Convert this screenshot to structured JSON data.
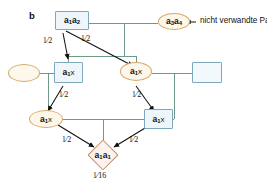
{
  "panel": {
    "label": "b"
  },
  "legend": {
    "text": "nicht verwandte Partner",
    "arrow_icon": "left-arrow-icon"
  },
  "nodes": [
    {
      "id": "founder_male",
      "shape": "square",
      "genotype_main": "a",
      "genotype_sub1": "1",
      "genotype_main2": "a",
      "genotype_sub2": "2",
      "text": "a1a2"
    },
    {
      "id": "unrelated_mate",
      "shape": "ellipse",
      "genotype_main": "a",
      "genotype_sub1": "3",
      "genotype_main2": "a",
      "genotype_sub2": "4",
      "text": "a3a4"
    },
    {
      "id": "spouse_left",
      "shape": "ellipse",
      "text": ""
    },
    {
      "id": "child_left",
      "shape": "square",
      "genotype_main": "a",
      "genotype_sub1": "1",
      "genotype_x": "x",
      "text": "a1x"
    },
    {
      "id": "child_right",
      "shape": "ellipse",
      "genotype_main": "a",
      "genotype_sub1": "1",
      "genotype_x": "x",
      "text": "a1x"
    },
    {
      "id": "spouse_right",
      "shape": "square",
      "text": ""
    },
    {
      "id": "grandchild_left",
      "shape": "ellipse",
      "genotype_main": "a",
      "genotype_sub1": "1",
      "genotype_x": "x",
      "text": "a1x"
    },
    {
      "id": "grandchild_right",
      "shape": "square",
      "genotype_main": "a",
      "genotype_sub1": "1",
      "genotype_x": "x",
      "text": "a1x"
    },
    {
      "id": "offspring",
      "shape": "diamond",
      "genotype_main": "a",
      "genotype_sub1": "1",
      "genotype_main2": "a",
      "genotype_sub2": "1",
      "text": "a1a1"
    }
  ],
  "probabilities": {
    "p_left_top": {
      "num": "1",
      "den": "2"
    },
    "p_right_top": {
      "num": "1",
      "den": "2"
    },
    "p_left_mid": {
      "num": "1",
      "den": "2"
    },
    "p_right_mid": {
      "num": "1",
      "den": "2"
    },
    "p_left_bottom": {
      "num": "1",
      "den": "2"
    },
    "p_right_bottom": {
      "num": "1",
      "den": "2"
    },
    "p_final": {
      "num": "1",
      "den": "16"
    }
  },
  "colors": {
    "male_stroke": "#7fa8bd",
    "male_fill": "#eef6fb",
    "female_stroke": "#d6a768",
    "female_fill": "#fdf6ea",
    "offspring_stroke": "#c08a6a",
    "offspring_fill": "#fdf3ec",
    "pedigree_line": "#5f8f78",
    "transmission_arrow": "#111111",
    "text": "#1a1a1a"
  }
}
